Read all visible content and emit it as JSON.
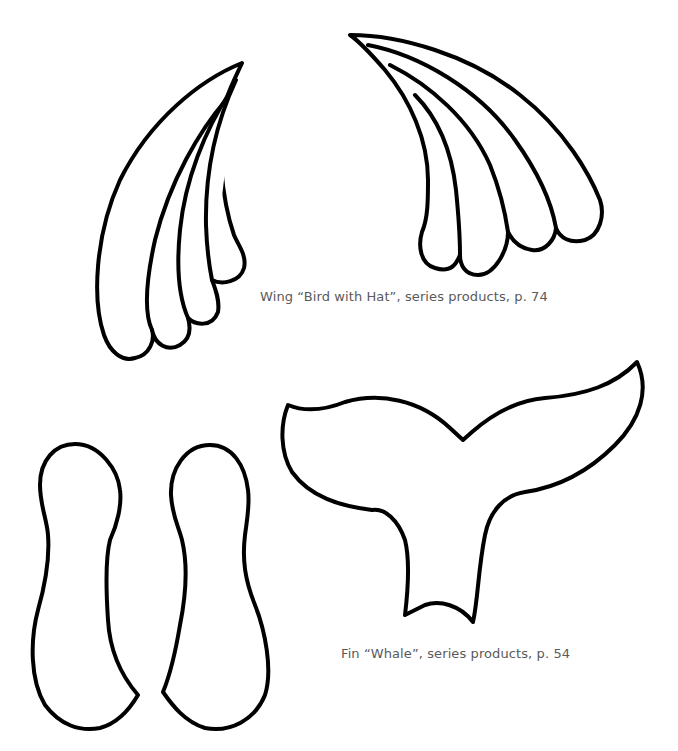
{
  "page": {
    "background": "#ffffff",
    "outline_color": "#000000",
    "caption_color": "#5a5a5a"
  },
  "templates": [
    {
      "id": "wing-left",
      "label": "Left wing outline (4 feathers)"
    },
    {
      "id": "wing-right",
      "label": "Right wing outline (4 feathers)"
    },
    {
      "id": "whale-fin",
      "label": "Whale tail fin outline"
    },
    {
      "id": "foot-left",
      "label": "Left foot outline"
    },
    {
      "id": "foot-right",
      "label": "Right foot outline"
    }
  ],
  "captions": {
    "wing": "Wing “Bird with Hat”, series products, p. 74",
    "fin": "Fin “Whale”, series products, p. 54"
  }
}
